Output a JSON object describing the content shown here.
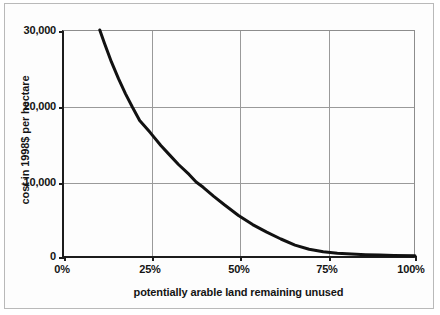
{
  "figure": {
    "has_outer_border": true,
    "background_color": "#fdfdfd",
    "line_color": "#111111",
    "grid_color": "#9a9a9a",
    "axis_color": "#1c1c1c"
  },
  "axis_titles": {
    "y": "cost in 1998$ per hectare",
    "x": "potentially arable land remaining unused"
  },
  "ticks": {
    "y_labels": [
      "30,000",
      "20,000",
      "10,000",
      "0"
    ],
    "y_values": [
      30000,
      20000,
      10000,
      0
    ],
    "x_labels": [
      "0%",
      "25%",
      "50%",
      "75%",
      "100%"
    ],
    "x_values": [
      0,
      25,
      50,
      75,
      100
    ]
  },
  "chart_data": {
    "type": "line",
    "title": "",
    "subtitle": "",
    "xlabel": "potentially arable land remaining unused",
    "ylabel": "cost in 1998$ per hectare",
    "xlim": [
      0,
      100
    ],
    "ylim": [
      0,
      30000
    ],
    "xtick_labels": [
      "0%",
      "25%",
      "50%",
      "75%",
      "100%"
    ],
    "xticks": [
      0,
      25,
      50,
      75,
      100
    ],
    "ytick_labels": [
      "30,000",
      "20,000",
      "10,000",
      "0"
    ],
    "yticks": [
      30000,
      20000,
      10000,
      0
    ],
    "grid": true,
    "grid_axes": "both",
    "legend": "none",
    "annotations": [],
    "series": [
      {
        "name": "cost of bringing land into cultivation",
        "color": "#111111",
        "line_width": 3,
        "x": [
          10.7,
          12,
          14,
          16,
          18,
          20,
          22,
          25,
          28,
          30,
          33,
          36,
          38,
          40,
          43,
          46,
          50,
          54,
          58,
          62,
          66,
          70,
          74,
          78,
          82,
          86,
          90,
          94,
          100
        ],
        "y": [
          30000,
          28300,
          25800,
          23600,
          21600,
          19800,
          18100,
          16500,
          14800,
          13800,
          12300,
          11000,
          10000,
          9300,
          8100,
          7000,
          5600,
          4400,
          3400,
          2500,
          1700,
          1150,
          820,
          640,
          520,
          430,
          380,
          340,
          300
        ]
      }
    ]
  }
}
